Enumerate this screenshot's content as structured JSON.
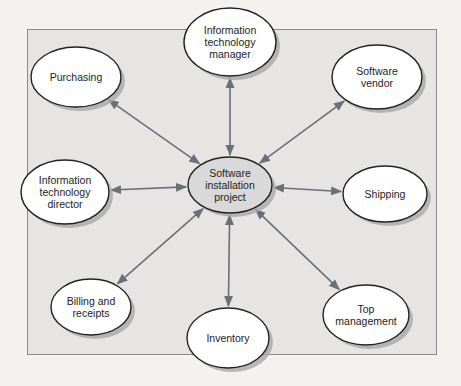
{
  "diagram": {
    "type": "hub-and-spoke stakeholder diagram",
    "colors": {
      "frame_fill": "#e6e5e3",
      "frame_border": "#8a8a8a",
      "node_fill": "#ffffff",
      "hub_fill": "#d9d9d9",
      "node_stroke": "#222222",
      "arrow": "#6b6f78",
      "shadow": "#a8a8a8"
    },
    "hub": {
      "id": "hub",
      "label": "Software\ninstallation\nproject",
      "cx": 230,
      "cy": 185,
      "rx": 42,
      "ry": 28
    },
    "nodes": [
      {
        "id": "purchasing",
        "label": "Purchasing",
        "cx": 76,
        "cy": 77,
        "rx": 45,
        "ry": 30
      },
      {
        "id": "it-manager",
        "label": "Information\ntechnology\nmanager",
        "cx": 230,
        "cy": 42,
        "rx": 46,
        "ry": 34
      },
      {
        "id": "software-vendor",
        "label": "Software\nvendor",
        "cx": 377,
        "cy": 77,
        "rx": 45,
        "ry": 32
      },
      {
        "id": "it-director",
        "label": "Information\ntechnology\ndirector",
        "cx": 65,
        "cy": 192,
        "rx": 44,
        "ry": 32
      },
      {
        "id": "shipping",
        "label": "Shipping",
        "cx": 385,
        "cy": 194,
        "rx": 42,
        "ry": 28
      },
      {
        "id": "billing",
        "label": "Billing and\nreceipts",
        "cx": 91,
        "cy": 307,
        "rx": 40,
        "ry": 28
      },
      {
        "id": "inventory",
        "label": "Inventory",
        "cx": 228,
        "cy": 338,
        "rx": 41,
        "ry": 30
      },
      {
        "id": "top-management",
        "label": "Top\nmanagement",
        "cx": 366,
        "cy": 315,
        "rx": 43,
        "ry": 30
      }
    ],
    "edges": [
      {
        "from": "hub",
        "to": "purchasing",
        "direction": "both"
      },
      {
        "from": "hub",
        "to": "it-manager",
        "direction": "both"
      },
      {
        "from": "hub",
        "to": "software-vendor",
        "direction": "both"
      },
      {
        "from": "hub",
        "to": "it-director",
        "direction": "both"
      },
      {
        "from": "hub",
        "to": "shipping",
        "direction": "both"
      },
      {
        "from": "hub",
        "to": "billing",
        "direction": "both"
      },
      {
        "from": "hub",
        "to": "inventory",
        "direction": "both"
      },
      {
        "from": "hub",
        "to": "top-management",
        "direction": "both"
      }
    ]
  }
}
